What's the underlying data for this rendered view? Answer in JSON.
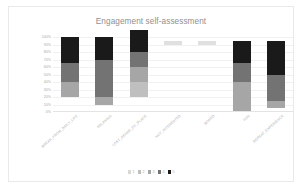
{
  "chart_data": {
    "type": "bar",
    "subtype": "stacked-percent",
    "title": "Engagement self-assessment",
    "xlabel": "",
    "ylabel": "",
    "ylim": [
      0,
      100
    ],
    "grid": true,
    "legend_position": "bottom",
    "ytick_labels": [
      "100%",
      "90%",
      "80%",
      "70%",
      "60%",
      "50%",
      "40%",
      "30%",
      "20%",
      "10%",
      "0%"
    ],
    "ytick_values": [
      100,
      90,
      80,
      70,
      60,
      50,
      40,
      30,
      20,
      10,
      0
    ],
    "categories": [
      "BREAK_FROM_DAILY_LIFE",
      "RELAXING",
      "LOST_SENSE_OF_PLACE",
      "NOT_INTERESTED",
      "BORED",
      "FUN",
      "REPEAT_EXPERIENCE"
    ],
    "series": [
      {
        "name": "1",
        "color": "#d9d9d9",
        "values": [
          0,
          0,
          0,
          0,
          0,
          0,
          0
        ]
      },
      {
        "name": "2",
        "color": "#bfbfbf",
        "values": [
          0,
          0,
          20,
          0,
          0,
          0,
          0
        ]
      },
      {
        "name": "3",
        "color": "#a6a6a6",
        "values": [
          20,
          10,
          20,
          0,
          0,
          40,
          10
        ]
      },
      {
        "name": "4",
        "color": "#737373",
        "values": [
          25,
          50,
          20,
          0,
          0,
          25,
          35
        ]
      },
      {
        "name": "5",
        "color": "#1a1a1a",
        "values": [
          35,
          30,
          30,
          0,
          0,
          30,
          45
        ]
      }
    ],
    "bar_tops": [
      80,
      90,
      90,
      95,
      95,
      95,
      90
    ],
    "bar_bottoms": [
      20,
      10,
      20,
      90,
      90,
      0,
      5
    ],
    "legend_entries": [
      "1",
      "2",
      "3",
      "4",
      "5"
    ]
  },
  "legend": {
    "items": [
      {
        "label": "1",
        "color": "#d9d9d9"
      },
      {
        "label": "2",
        "color": "#bfbfbf"
      },
      {
        "label": "3",
        "color": "#a6a6a6"
      },
      {
        "label": "4",
        "color": "#737373"
      },
      {
        "label": "5",
        "color": "#1a1a1a"
      }
    ]
  }
}
